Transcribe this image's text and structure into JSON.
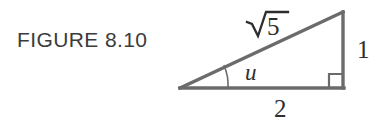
{
  "figure": {
    "caption": "FIGURE 8.10",
    "background_color": "#ffffff",
    "caption_color": "#3b3b3b",
    "line_color": "#6b6b6b",
    "label_color": "#2e2e2e",
    "diagram": {
      "type": "right-triangle",
      "hypotenuse_label": "5",
      "hypotenuse_label_full": "√5",
      "opposite_side_label": "1",
      "adjacent_side_label": "2",
      "angle_label": "u",
      "right_angle_marker": true,
      "vertices": {
        "left": [
          180,
          88
        ],
        "bottom_right": [
          343,
          88
        ],
        "top_right": [
          343,
          12
        ]
      }
    }
  }
}
